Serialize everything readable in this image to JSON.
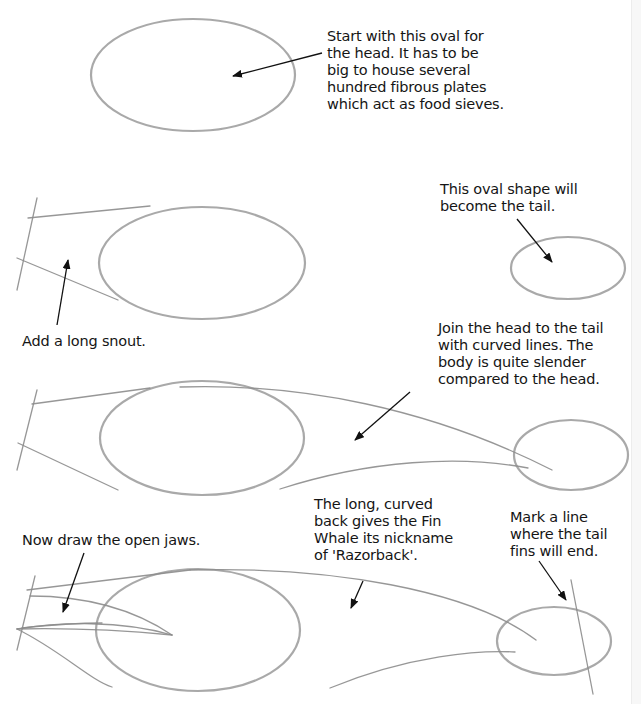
{
  "colors": {
    "background": "#ffffff",
    "pencil": "#9a9a9a",
    "ink": "#151515"
  },
  "steps": [
    {
      "id": 1,
      "caption": "Start with this oval for\nthe head. It has to be\nbig to house several\nhundred fibrous plates\nwhich act as food sieves."
    },
    {
      "id": 2,
      "caption_tail": "This oval shape will\nbecome the tail.",
      "caption_snout": "Add a long snout."
    },
    {
      "id": 3,
      "caption": "Join the head to the tail\nwith curved lines. The\nbody is quite slender\ncompared to the head."
    },
    {
      "id": 4,
      "caption_jaws": "Now draw the open jaws.",
      "caption_back": "The long, curved\nback gives the Fin\nWhale its nickname\nof 'Razorback'.",
      "caption_fins": "Mark a line\nwhere the tail\nfins will end."
    }
  ]
}
